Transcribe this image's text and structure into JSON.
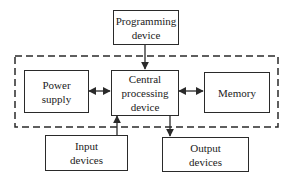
{
  "diagram": {
    "type": "block-diagram",
    "colors": {
      "line": "#2a2a2a",
      "background": "#ffffff"
    },
    "nodes": {
      "programming": {
        "lines": [
          "Programming",
          "device"
        ]
      },
      "power": {
        "lines": [
          "Power",
          "supply"
        ]
      },
      "cpu": {
        "lines": [
          "Central",
          "processing",
          "device"
        ]
      },
      "memory": {
        "lines": [
          "Memory"
        ]
      },
      "input": {
        "lines": [
          "Input",
          "devices"
        ]
      },
      "output": {
        "lines": [
          "Output",
          "devices"
        ]
      }
    },
    "edges": [
      {
        "from": "programming",
        "to": "cpu",
        "style": "arrow"
      },
      {
        "from": "power",
        "to": "cpu",
        "style": "bidirectional"
      },
      {
        "from": "cpu",
        "to": "memory",
        "style": "bidirectional"
      },
      {
        "from": "input",
        "to": "cpu",
        "style": "arrow"
      },
      {
        "from": "cpu",
        "to": "output",
        "style": "arrow"
      }
    ],
    "group": {
      "style": "dashed",
      "members": [
        "power",
        "cpu",
        "memory"
      ]
    }
  }
}
